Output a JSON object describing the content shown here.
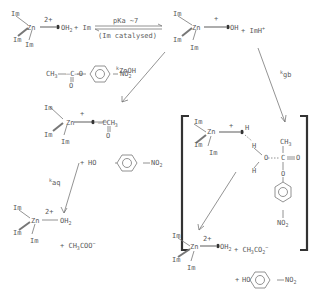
{
  "reaction": {
    "step1": {
      "reactant_complex": {
        "metal": "Zn",
        "charge": "2+",
        "ligands": [
          "Im",
          "Im",
          "Im"
        ],
        "bound": "OH",
        "bound_sub": "2"
      },
      "plus_im": "+ Im",
      "arrow_top": "pKa ~7",
      "arrow_bottom": "(Im catalysed)",
      "product_complex": {
        "metal": "Zn",
        "charge": "+",
        "ligands": [
          "Im",
          "Im",
          "Im"
        ],
        "bound": "OH"
      },
      "plus_imh": "+ ImH",
      "imh_charge": "+"
    },
    "substrate": {
      "left": "CH",
      "left_sub": "3",
      "mid": "—C—O",
      "carbonyl_O": "O",
      "right": "NO",
      "right_sub": "2"
    },
    "k_znoh": {
      "k": "k",
      "sub": "ZnOH"
    },
    "k_gb": {
      "k": "k",
      "sub": "gb"
    },
    "k_aq": {
      "k": "k",
      "sub": "aq"
    },
    "acyl_complex": {
      "metal": "Zn",
      "charge": "+",
      "ligands": [
        "Im",
        "Im",
        "Im"
      ],
      "group": "—CCH",
      "group_sub": "3",
      "carbonyl_O": "O"
    },
    "phenol1": {
      "plus": "+",
      "ho": "HO",
      "no2": "NO",
      "no2_sub": "2"
    },
    "aqua_complex_left": {
      "metal": "Zn",
      "charge": "2+",
      "ligands": [
        "Im",
        "Im",
        "Im"
      ],
      "bound": "OH",
      "bound_sub": "2",
      "plus_acetate": "+ CH",
      "acetate_sub": "3",
      "acetate_rest": "COO",
      "acetate_charge": "−"
    },
    "transition_state": {
      "metal": "Zn",
      "charge": "+",
      "ligands": [
        "Im",
        "Im",
        "Im"
      ],
      "h1": "H",
      "h2": "H",
      "o": "O",
      "h3": "H",
      "ch3": "CH",
      "ch3_sub": "3",
      "c": "C",
      "o_carbonyl": "O",
      "o_ester": "O",
      "no2": "NO",
      "no2_sub": "2"
    },
    "final_products": {
      "metal": "Zn",
      "charge": "2+",
      "ligands": [
        "Im",
        "Im",
        "Im"
      ],
      "bound": "OH",
      "bound_sub": "2",
      "plus_acetate": "+ CH",
      "acetate_sub": "3",
      "acetate_rest": "CO",
      "acetate_sub2": "2",
      "acetate_charge": "−",
      "phenol": {
        "plus": "+",
        "ho": "HO",
        "no2": "NO",
        "no2_sub": "2"
      }
    }
  }
}
